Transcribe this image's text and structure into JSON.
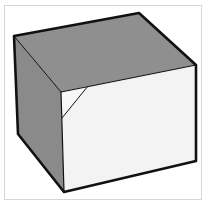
{
  "figure": {
    "colors": {
      "top_face": "#8f8f8f",
      "left_face": "#8a8a8a",
      "front_face": "#f3f3f3",
      "fold_flap": "#f7f7f7",
      "edge": "#111111",
      "frame_border": "#d6d6d6",
      "background": "#ffffff"
    }
  }
}
